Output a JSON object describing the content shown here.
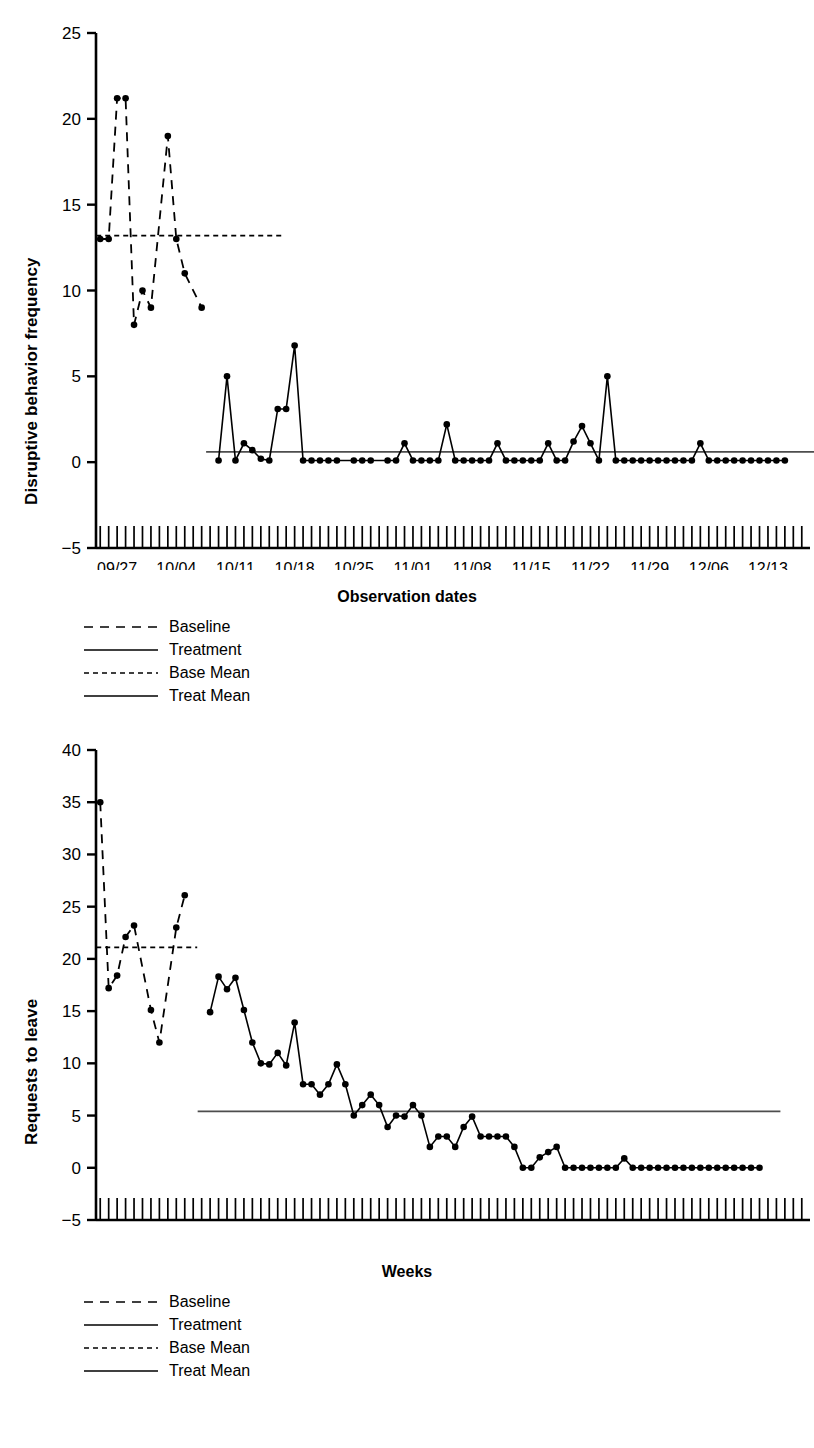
{
  "chart_data": [
    {
      "id": "chart1",
      "type": "line",
      "title": "",
      "xlabel": "Observation dates",
      "ylabel": "Disruptive behavior frequency",
      "ylim": [
        -5,
        25
      ],
      "yticks": [
        -5,
        0,
        5,
        10,
        15,
        20,
        25
      ],
      "xtick_labels": [
        "09/27",
        "10/04",
        "10/11",
        "10/18",
        "10/25",
        "11/01",
        "11/08",
        "11/15",
        "11/22",
        "11/29",
        "12/06",
        "12/13"
      ],
      "xtick_positions": [
        2,
        9,
        16,
        23,
        30,
        37,
        44,
        51,
        58,
        65,
        72,
        79
      ],
      "n_minor_ticks": 84,
      "grid": false,
      "legend_position": "below-left",
      "series": [
        {
          "name": "Baseline",
          "style": "dashed-long",
          "x": [
            0,
            1,
            2,
            3,
            4,
            5,
            6,
            8,
            9,
            10,
            12
          ],
          "values": [
            13,
            13,
            21.2,
            21.2,
            8,
            10,
            9,
            19,
            13,
            11,
            9
          ]
        },
        {
          "name": "Treatment",
          "style": "solid",
          "x": [
            14,
            15,
            16,
            17,
            18,
            19,
            20,
            21,
            22,
            23,
            24,
            25,
            26,
            27,
            28,
            30,
            31,
            32,
            34,
            35,
            36,
            37,
            38,
            39,
            40,
            41,
            42,
            43,
            44,
            45,
            46,
            47,
            48,
            49,
            50,
            51,
            52,
            53,
            54,
            55,
            56,
            57,
            58,
            59,
            60,
            61,
            62,
            63,
            64,
            65,
            66,
            67,
            68,
            69,
            70,
            71,
            72,
            73,
            74,
            75,
            76,
            77,
            78,
            79,
            80,
            81
          ],
          "values": [
            0.1,
            5,
            0.1,
            1.1,
            0.7,
            0.2,
            0.1,
            3.1,
            3.1,
            6.8,
            0.1,
            0.1,
            0.1,
            0.1,
            0.1,
            0.1,
            0.1,
            0.1,
            0.1,
            0.1,
            1.1,
            0.1,
            0.1,
            0.1,
            0.1,
            2.2,
            0.1,
            0.1,
            0.1,
            0.1,
            0.1,
            1.1,
            0.1,
            0.1,
            0.1,
            0.1,
            0.1,
            1.1,
            0.1,
            0.1,
            1.2,
            2.1,
            1.1,
            0.1,
            5,
            0.1,
            0.1,
            0.1,
            0.1,
            0.1,
            0.1,
            0.1,
            0.1,
            0.1,
            0.1,
            1.1,
            0.1,
            0.1,
            0.1,
            0.1,
            0.1,
            0.1,
            0.1,
            0.1,
            0.1,
            0.1
          ]
        }
      ],
      "reference_lines": [
        {
          "name": "Base Mean",
          "style": "dashed-short",
          "value": 13.2,
          "x_start": 0,
          "x_end": 21
        },
        {
          "name": "Treat Mean",
          "style": "solid",
          "value": 0.6,
          "x_start": 13,
          "x_end": 84
        }
      ]
    },
    {
      "id": "chart2",
      "type": "line",
      "title": "",
      "xlabel": "Weeks",
      "ylabel": "Requests to leave",
      "ylim": [
        -5,
        40
      ],
      "yticks": [
        -5,
        0,
        5,
        10,
        15,
        20,
        25,
        30,
        35,
        40
      ],
      "xtick_labels": [
        "09/04",
        "09/11",
        "09/18",
        "09/25",
        "10/02",
        "10/09",
        "10/16",
        "10/23",
        "10/30",
        "11/06",
        "11/13",
        "11/20"
      ],
      "xtick_positions": [
        2,
        9,
        16,
        23,
        30,
        37,
        44,
        51,
        58,
        65,
        72,
        79
      ],
      "n_minor_ticks": 84,
      "grid": false,
      "legend_position": "below-left",
      "series": [
        {
          "name": "Baseline",
          "style": "dashed-long",
          "x": [
            0,
            1,
            2,
            3,
            4,
            6,
            7,
            9,
            10
          ],
          "values": [
            35,
            17.2,
            18.4,
            22.1,
            23.2,
            15.1,
            12,
            23,
            26.1
          ]
        },
        {
          "name": "Treatment",
          "style": "solid",
          "x": [
            13,
            14,
            15,
            16,
            17,
            18,
            19,
            20,
            21,
            22,
            23,
            24,
            25,
            26,
            27,
            28,
            29,
            30,
            31,
            32,
            33,
            34,
            35,
            36,
            37,
            38,
            39,
            40,
            41,
            42,
            43,
            44,
            45,
            46,
            47,
            48,
            49,
            50,
            51,
            52,
            53,
            54,
            55,
            56,
            57,
            58,
            59,
            60,
            61,
            62,
            63,
            64,
            65,
            66,
            67,
            68,
            69,
            70,
            71,
            72,
            73,
            74,
            75,
            76,
            77,
            78
          ],
          "values": [
            14.9,
            18.3,
            17.1,
            18.2,
            15.1,
            12,
            10,
            9.9,
            11,
            9.8,
            13.9,
            8,
            8,
            7,
            8,
            9.9,
            8,
            5,
            6,
            7,
            6,
            3.9,
            5,
            4.9,
            6,
            5,
            2,
            3,
            3,
            2,
            3.9,
            4.9,
            3,
            3,
            3,
            3,
            2,
            0,
            0,
            1,
            1.5,
            2,
            0,
            0,
            0,
            0,
            0,
            0,
            0,
            0.9,
            0,
            0,
            0,
            0,
            0,
            0,
            0,
            0,
            0,
            0,
            0,
            0,
            0,
            0,
            0,
            0
          ]
        }
      ],
      "reference_lines": [
        {
          "name": "Base Mean",
          "style": "dashed-short",
          "value": 21.1,
          "x_start": 0,
          "x_end": 11
        },
        {
          "name": "Treat Mean",
          "style": "solid",
          "value": 5.4,
          "x_start": 12,
          "x_end": 80
        }
      ]
    }
  ],
  "charts": {
    "chart1": {
      "ylabel": "Disruptive behavior frequency",
      "xlabel": "Observation dates"
    },
    "chart2": {
      "ylabel": "Requests to leave",
      "xlabel": "Weeks"
    }
  },
  "legend": {
    "items": [
      {
        "label": "Baseline",
        "style": "dashed-long"
      },
      {
        "label": "Treatment",
        "style": "solid"
      },
      {
        "label": "Base Mean",
        "style": "dashed-short"
      },
      {
        "label": "Treat Mean",
        "style": "solid"
      }
    ]
  },
  "colors": {
    "line": "#000000",
    "marker": "#000000",
    "axis": "#000000",
    "mean_line": "#4d4d4d",
    "background": "#ffffff"
  }
}
